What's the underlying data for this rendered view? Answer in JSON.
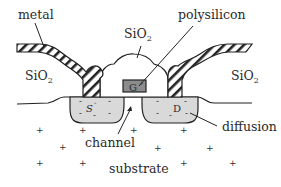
{
  "figure": {
    "labels": {
      "metal": "metal",
      "polysilicon": "polysilicon",
      "oxide_left_main": "SiO",
      "oxide_left_sub": "2",
      "oxide_center_main": "SiO",
      "oxide_center_sub": "2",
      "oxide_right_main": "SiO",
      "oxide_right_sub": "2",
      "gate": "G",
      "gate_sup": "+",
      "source": "S",
      "source_sup": "-",
      "drain": "D",
      "drain_sup": "-",
      "channel": "channel",
      "diffusion": "diffusion",
      "substrate": "substrate"
    },
    "symbols": {
      "substrate_charge": "+",
      "diffusion_charge": "-"
    },
    "colors": {
      "background": "#ffffff",
      "line": "#222222",
      "diffusion_fill": "#d9d9d9",
      "gate_fill": "#8c8c8c"
    }
  }
}
